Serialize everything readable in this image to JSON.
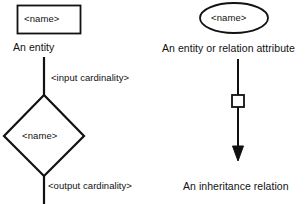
{
  "diagram": {
    "background_color": "#ffffff",
    "stroke_color": "#111111",
    "entity": {
      "shape": "rectangle",
      "label": "<name>",
      "caption": "An entity"
    },
    "attribute": {
      "shape": "ellipse",
      "label": "<name>",
      "caption": "An entity or relation attribute"
    },
    "relation": {
      "shape": "diamond",
      "label": "<name>",
      "input_edge_label": "<input cardinality>",
      "output_edge_label": "<output cardinality>"
    },
    "inheritance": {
      "shape": "arrow-with-square",
      "caption": "An inheritance relation"
    }
  }
}
